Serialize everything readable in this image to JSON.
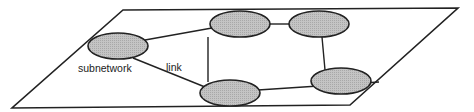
{
  "diagram": {
    "type": "network-topology",
    "labels": {
      "subnetwork": "subnetwork",
      "link": "link"
    },
    "plane": {
      "shape": "parallelogram",
      "points": [
        [
          123,
          10
        ],
        [
          458,
          8
        ],
        [
          350,
          105
        ],
        [
          12,
          108
        ]
      ]
    },
    "nodes": [
      {
        "id": "n1",
        "label": "subnetwork",
        "cx": 118,
        "cy": 46
      },
      {
        "id": "n2",
        "cx": 240,
        "cy": 24
      },
      {
        "id": "n3",
        "cx": 319,
        "cy": 24
      },
      {
        "id": "n4",
        "cx": 407,
        "cy": 81
      },
      {
        "id": "n5",
        "cx": 230,
        "cy": 93
      }
    ],
    "links": [
      {
        "from": "n1",
        "to": "n2"
      },
      {
        "from": "n1",
        "to": "n5",
        "label": "link"
      },
      {
        "from": "n2",
        "to": "n3"
      },
      {
        "from": "n2",
        "to": "n5"
      },
      {
        "from": "n3",
        "to": "n4"
      },
      {
        "from": "n5",
        "to": "n4"
      }
    ],
    "colors": {
      "node_fill": "#bdbdbd",
      "stroke": "#222222",
      "background": "#ffffff"
    }
  }
}
